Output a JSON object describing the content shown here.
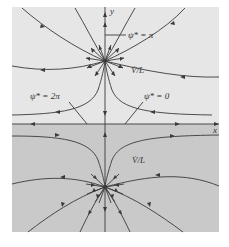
{
  "figure": {
    "type": "streamline-diagram",
    "colors": {
      "upper_region": "#e6e6e6",
      "lower_region": "#c9c9c9",
      "lines": "#3a3a3a"
    },
    "axes": {
      "x_label": "x",
      "y_label": "y"
    },
    "source": {
      "label": "V̇/L",
      "position": "upper",
      "kind": "source"
    },
    "sink": {
      "label": "V̇/L",
      "position": "lower",
      "kind": "sink"
    },
    "streamline_labels": [
      {
        "text": "ψ* = π",
        "target": "positive y-axis between source and top"
      },
      {
        "text": "ψ* = 2π",
        "target": "left x-axis"
      },
      {
        "text": "ψ* = 0",
        "target": "right x-axis"
      }
    ]
  }
}
